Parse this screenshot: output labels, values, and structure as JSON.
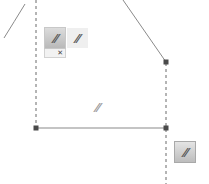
{
  "canvas": {
    "background": "#ffffff",
    "line_color": "#8a8a8a",
    "dashed_color": "#6b6b6b",
    "vertex_color": "#4a4a4a"
  },
  "constraint_toolbar": {
    "selected_button": {
      "icon": "parallel-constraint-icon",
      "glyph": "//"
    },
    "secondary_button": {
      "icon": "parallel-constraint-icon",
      "glyph": "//"
    },
    "sub_menu": {
      "delete_glyph": "✕"
    }
  },
  "constraint_labels": [
    {
      "name": "parallel-label-middle",
      "glyph": "//"
    }
  ],
  "corner_button": {
    "icon": "parallel-constraint-icon",
    "glyph": "//"
  }
}
